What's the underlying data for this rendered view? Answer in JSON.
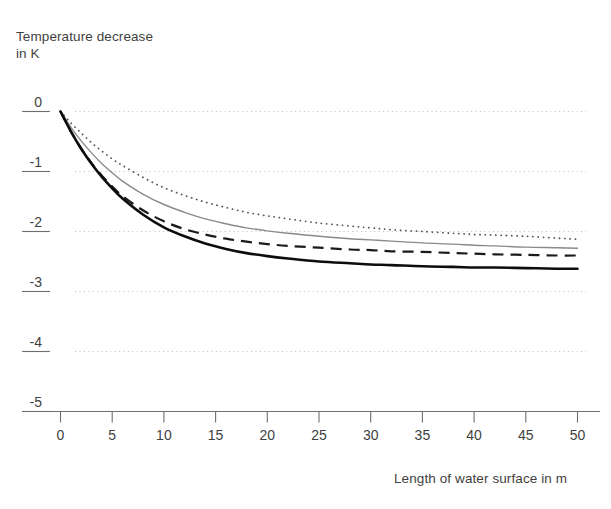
{
  "chart_data": {
    "type": "line",
    "title": "",
    "xlabel": "Length of water surface in m",
    "ylabel": "Temperature decrease\nin K",
    "ylabel_lines": [
      "Temperature decrease",
      "in K"
    ],
    "xlim": [
      0,
      50
    ],
    "ylim": [
      -5,
      0
    ],
    "xticks": [
      0,
      5,
      10,
      15,
      20,
      25,
      30,
      35,
      40,
      45,
      50
    ],
    "xtick_labels": [
      "0",
      "5",
      "10",
      "15",
      "20",
      "25",
      "30",
      "35",
      "40",
      "45",
      "50"
    ],
    "yticks": [
      0,
      -1,
      -2,
      -3,
      -4,
      -5
    ],
    "ytick_labels": [
      "0",
      "-1",
      "-2",
      "-3",
      "-4",
      "-5"
    ],
    "grid": "horizontal-dotted",
    "legend": "none",
    "x": [
      0,
      1,
      2,
      3,
      4,
      5,
      6,
      8,
      10,
      12,
      14,
      16,
      18,
      20,
      22,
      25,
      28,
      30,
      32,
      35,
      38,
      40,
      42,
      45,
      48,
      50
    ],
    "series": [
      {
        "name": "curve-dotted",
        "style": "dotted",
        "color": "#555555",
        "width": 1.8,
        "asymptote": -2.13,
        "values": [
          0,
          -0.19,
          -0.36,
          -0.52,
          -0.66,
          -0.79,
          -0.9,
          -1.1,
          -1.27,
          -1.4,
          -1.51,
          -1.6,
          -1.68,
          -1.74,
          -1.79,
          -1.86,
          -1.91,
          -1.94,
          -1.97,
          -2.0,
          -2.03,
          -2.05,
          -2.06,
          -2.08,
          -2.11,
          -2.13
        ]
      },
      {
        "name": "curve-gray-solid",
        "style": "solid",
        "color": "#8a8a8a",
        "width": 1.4,
        "asymptote": -2.28,
        "values": [
          0,
          -0.26,
          -0.49,
          -0.69,
          -0.87,
          -1.02,
          -1.16,
          -1.38,
          -1.55,
          -1.68,
          -1.79,
          -1.87,
          -1.94,
          -1.99,
          -2.03,
          -2.08,
          -2.12,
          -2.14,
          -2.16,
          -2.19,
          -2.21,
          -2.23,
          -2.24,
          -2.26,
          -2.27,
          -2.28
        ]
      },
      {
        "name": "curve-black-dashed",
        "style": "dashed",
        "color": "#1a1a1a",
        "width": 2.2,
        "asymptote": -2.4,
        "values": [
          0,
          -0.33,
          -0.62,
          -0.86,
          -1.07,
          -1.25,
          -1.41,
          -1.65,
          -1.83,
          -1.96,
          -2.05,
          -2.12,
          -2.17,
          -2.21,
          -2.24,
          -2.27,
          -2.3,
          -2.31,
          -2.33,
          -2.34,
          -2.36,
          -2.37,
          -2.38,
          -2.39,
          -2.4,
          -2.4
        ]
      },
      {
        "name": "curve-black-solid",
        "style": "solid",
        "color": "#0d0d0d",
        "width": 2.6,
        "asymptote": -2.62,
        "values": [
          0,
          -0.33,
          -0.62,
          -0.87,
          -1.09,
          -1.28,
          -1.45,
          -1.72,
          -1.93,
          -2.08,
          -2.2,
          -2.29,
          -2.36,
          -2.41,
          -2.45,
          -2.5,
          -2.53,
          -2.55,
          -2.56,
          -2.58,
          -2.59,
          -2.6,
          -2.6,
          -2.61,
          -2.62,
          -2.62
        ]
      }
    ]
  },
  "colors": {
    "axis": "#6e6e6e",
    "grid": "#c8c8c8",
    "text": "#3f3f3f",
    "background": "#ffffff"
  }
}
